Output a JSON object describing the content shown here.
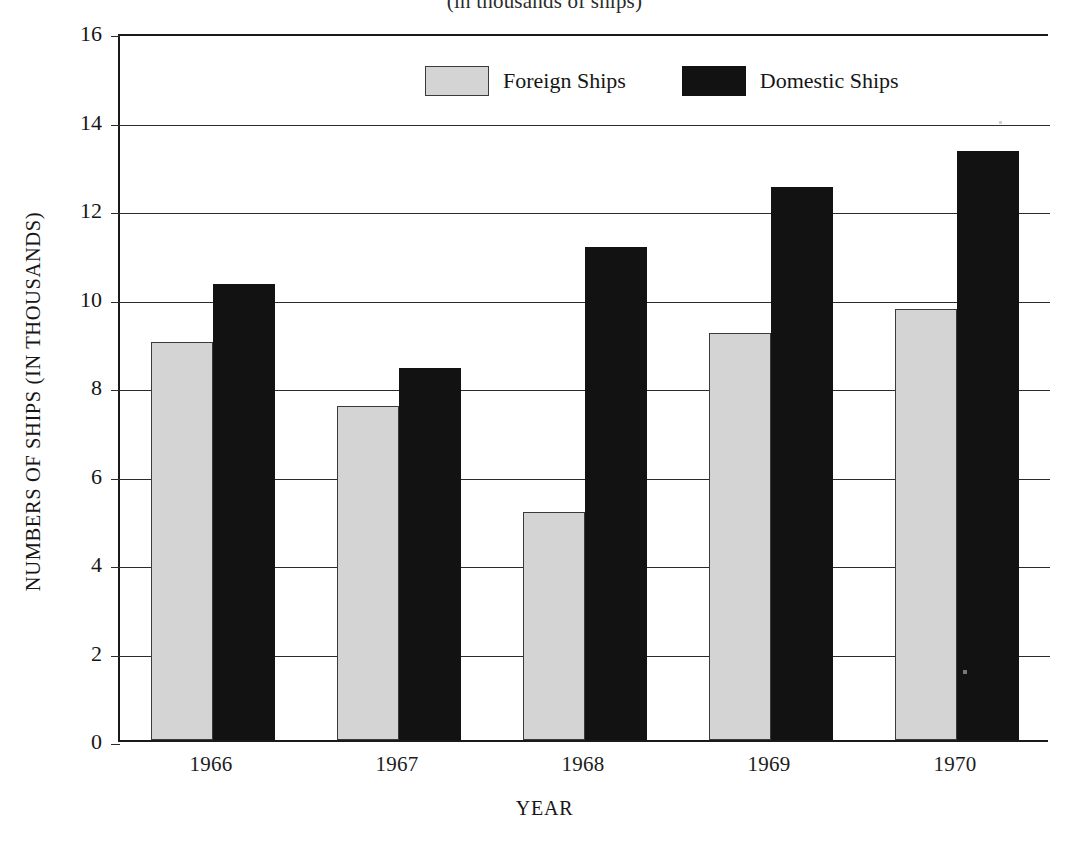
{
  "chart_data": {
    "type": "bar",
    "title": "(in thousands of ships)",
    "xlabel": "YEAR",
    "ylabel": "NUMBERS OF SHIPS (IN THOUSANDS)",
    "categories": [
      "1966",
      "1967",
      "1968",
      "1969",
      "1970"
    ],
    "series": [
      {
        "name": "Foreign Ships",
        "color": "#d4d4d4",
        "values": [
          9.0,
          7.55,
          5.15,
          9.2,
          9.75
        ]
      },
      {
        "name": "Domestic Ships",
        "color": "#121212",
        "values": [
          10.3,
          8.4,
          11.15,
          12.5,
          13.3
        ]
      }
    ],
    "ylim": [
      0,
      16
    ],
    "ytick_labels": [
      "16",
      "14",
      "12",
      "10",
      "8",
      "6",
      "4",
      "2",
      "0"
    ],
    "ytick_values": [
      16,
      14,
      12,
      10,
      8,
      6,
      4,
      2,
      0
    ],
    "grid": true,
    "legend_position": "top-center"
  },
  "legend": {
    "entries": [
      {
        "label": "Foreign Ships",
        "swatch": "light-gray-swatch"
      },
      {
        "label": "Domestic Ships",
        "swatch": "black-swatch"
      }
    ]
  }
}
